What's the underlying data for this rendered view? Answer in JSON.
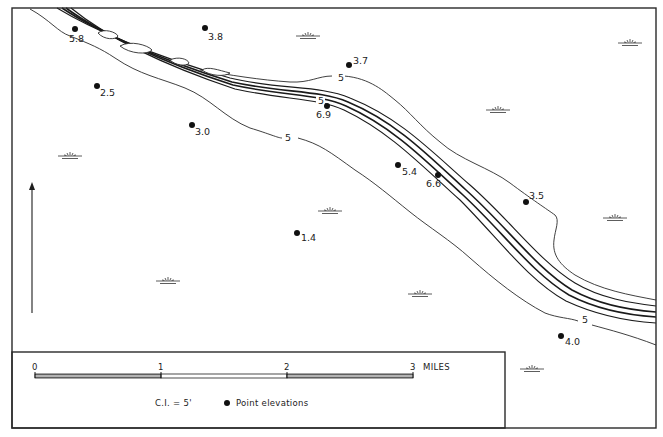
{
  "map": {
    "frame": {
      "x": 12,
      "y": 8,
      "w": 644,
      "h": 420
    },
    "colors": {
      "ink": "#1e1e1e",
      "background": "#ffffff",
      "scale_dark": "#8a8a8a"
    },
    "north_arrow": {
      "x": 32,
      "y_top": 182,
      "y_bottom": 313
    },
    "point_elevations": [
      {
        "x": 75,
        "y": 29,
        "label": "5.8",
        "lx": 69,
        "ly": 42
      },
      {
        "x": 205,
        "y": 28,
        "label": "3.8",
        "lx": 208,
        "ly": 40
      },
      {
        "x": 97,
        "y": 86,
        "label": "2.5",
        "lx": 100,
        "ly": 96
      },
      {
        "x": 192,
        "y": 125,
        "label": "3.0",
        "lx": 195,
        "ly": 135
      },
      {
        "x": 349,
        "y": 65,
        "label": "3.7",
        "lx": 353,
        "ly": 64
      },
      {
        "x": 327,
        "y": 106,
        "label": "6.9",
        "lx": 316,
        "ly": 118
      },
      {
        "x": 398,
        "y": 165,
        "label": "5.4",
        "lx": 402,
        "ly": 175
      },
      {
        "x": 438,
        "y": 175,
        "label": "6.6",
        "lx": 426,
        "ly": 187
      },
      {
        "x": 297,
        "y": 233,
        "label": "1.4",
        "lx": 301,
        "ly": 241
      },
      {
        "x": 526,
        "y": 202,
        "label": "3.5",
        "lx": 529,
        "ly": 199
      },
      {
        "x": 561,
        "y": 336,
        "label": "4.0",
        "lx": 565,
        "ly": 345
      }
    ],
    "contour_labels": [
      {
        "x": 338,
        "y": 81,
        "text": "5"
      },
      {
        "x": 318,
        "y": 104,
        "text": "5"
      },
      {
        "x": 285,
        "y": 141,
        "text": "5"
      },
      {
        "x": 582,
        "y": 323,
        "text": "5"
      }
    ],
    "marsh_symbols": [
      {
        "x": 308,
        "y": 36
      },
      {
        "x": 630,
        "y": 43
      },
      {
        "x": 498,
        "y": 110
      },
      {
        "x": 70,
        "y": 156
      },
      {
        "x": 330,
        "y": 211
      },
      {
        "x": 615,
        "y": 218
      },
      {
        "x": 168,
        "y": 281
      },
      {
        "x": 420,
        "y": 294
      },
      {
        "x": 532,
        "y": 369
      }
    ],
    "river": {
      "bank_north": "M 57 8 C 90 28, 150 55, 230 78 C 280 90, 320 85, 350 98 C 400 118, 430 150, 470 185 C 510 220, 540 262, 575 283 C 600 298, 630 303, 656 306",
      "channel_north": "M 62 8 C 95 30, 155 58, 232 82 C 282 93, 320 90, 348 102 C 396 122, 428 155, 466 190 C 506 226, 536 268, 572 290 C 598 304, 628 310, 656 312",
      "channel_south": "M 66 8 C 99 32, 158 61, 233 85 C 283 96, 320 94, 346 106 C 393 127, 425 160, 463 195 C 503 232, 532 273, 569 295 C 596 309, 626 315, 656 317",
      "bank_south": "M 71 8 C 104 35, 160 64, 235 89 C 285 100, 318 98, 344 110 C 390 132, 421 165, 460 200 C 498 238, 528 280, 566 301 C 594 314, 624 321, 656 323"
    },
    "contours": [
      "M 30 9 C 50 20, 58 32, 70 36 C 90 44, 100 48, 115 58 C 140 75, 160 78, 185 88 C 210 98, 225 118, 250 128 C 270 134, 278 138, 282 138",
      "M 298 138 C 320 144, 330 152, 355 170 C 375 183, 390 196, 410 212 C 430 228, 450 240, 470 258 C 495 280, 520 300, 545 313 C 558 318, 570 318, 578 321",
      "M 592 325 C 610 330, 630 335, 656 345",
      "M 200 70 C 230 75, 260 80, 290 82 C 310 83, 318 76, 332 76",
      "M 344 76 C 370 78, 385 92, 395 100 C 410 112, 420 126, 440 142 C 460 160, 490 168, 510 183 C 530 198, 548 210, 555 215 C 560 220, 555 230, 554 240 C 552 255, 560 265, 575 275 C 600 290, 630 295, 656 300"
    ],
    "islands": [
      "M 98 33 C 104 28, 116 32, 118 36 C 116 40, 104 40, 98 33 Z",
      "M 120 46 C 130 40, 148 45, 152 50 C 148 55, 130 54, 120 46 Z",
      "M 170 60 C 178 56, 188 59, 189 63 C 186 67, 175 65, 170 60 Z",
      "M 202 70 C 208 66, 218 70, 230 73 C 225 77, 210 76, 202 70 Z"
    ],
    "legend": {
      "box": {
        "x": 12,
        "y": 352,
        "w": 493,
        "h": 76
      },
      "scale_bar": {
        "x0": 35,
        "x1": 161,
        "x2": 287,
        "x3": 413,
        "y": 374,
        "h": 4,
        "tick_labels": [
          "0",
          "1",
          "2",
          "3"
        ],
        "unit_label": "MILES"
      },
      "contour_interval": "C.I. = 5'",
      "point_elevations_label": "Point elevations"
    }
  }
}
